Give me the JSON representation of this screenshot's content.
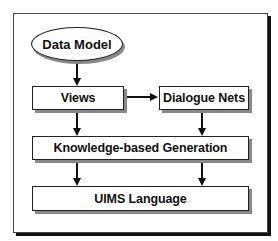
{
  "diagram": {
    "nodes": [
      {
        "id": "data-model",
        "label": "Data Model",
        "shape": "ellipse"
      },
      {
        "id": "views",
        "label": "Views",
        "shape": "box"
      },
      {
        "id": "dialogue-nets",
        "label": "Dialogue Nets",
        "shape": "box"
      },
      {
        "id": "knowledge-based-generation",
        "label": "Knowledge-based Generation",
        "shape": "box"
      },
      {
        "id": "uims-language",
        "label": "UIMS Language",
        "shape": "box"
      }
    ],
    "edges": [
      {
        "from": "data-model",
        "to": "views"
      },
      {
        "from": "views",
        "to": "dialogue-nets"
      },
      {
        "from": "views",
        "to": "knowledge-based-generation"
      },
      {
        "from": "dialogue-nets",
        "to": "knowledge-based-generation"
      },
      {
        "from": "knowledge-based-generation",
        "to": "uims-language"
      },
      {
        "from": "knowledge-based-generation",
        "to": "uims-language"
      }
    ],
    "colors": {
      "stroke": "#111111",
      "shadow": "#888888",
      "background": "#ffffff"
    }
  }
}
